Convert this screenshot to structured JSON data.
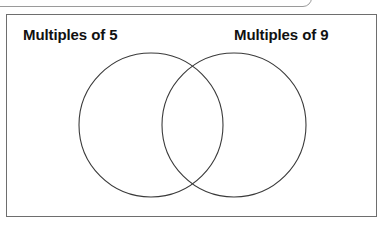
{
  "worksheet": {
    "top_partial_frame": {
      "present": true
    },
    "panel": {
      "border_color": "#6e6e6e",
      "background_color": "#ffffff"
    },
    "labels": {
      "left": "Multiples of 5",
      "right": "Multiples of 9"
    },
    "diagram": {
      "type": "venn",
      "stroke_color": "#3a3a3a",
      "fill": "none",
      "circles": [
        {
          "name": "multiples-of-5",
          "label": "Multiples of 5",
          "cx": 144,
          "cy": 110,
          "r": 72,
          "contents": []
        },
        {
          "name": "multiples-of-9",
          "label": "Multiples of 9",
          "cx": 227,
          "cy": 110,
          "r": 72,
          "contents": []
        }
      ],
      "intersection_contents": []
    }
  }
}
